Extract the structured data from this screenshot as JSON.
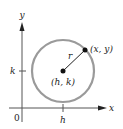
{
  "diagram": {
    "colors": {
      "axes": "#555555",
      "circle": "#9a9a9a",
      "points": "#111111",
      "text": "#222222"
    },
    "axes": {
      "x_label": "x",
      "y_label": "y",
      "origin_label": "0"
    },
    "ticks": {
      "x_tick_label": "h",
      "y_tick_label": "k"
    },
    "center": {
      "label": "(h, k)"
    },
    "radius": {
      "label": "r"
    },
    "point": {
      "label": "(x, y)"
    }
  }
}
